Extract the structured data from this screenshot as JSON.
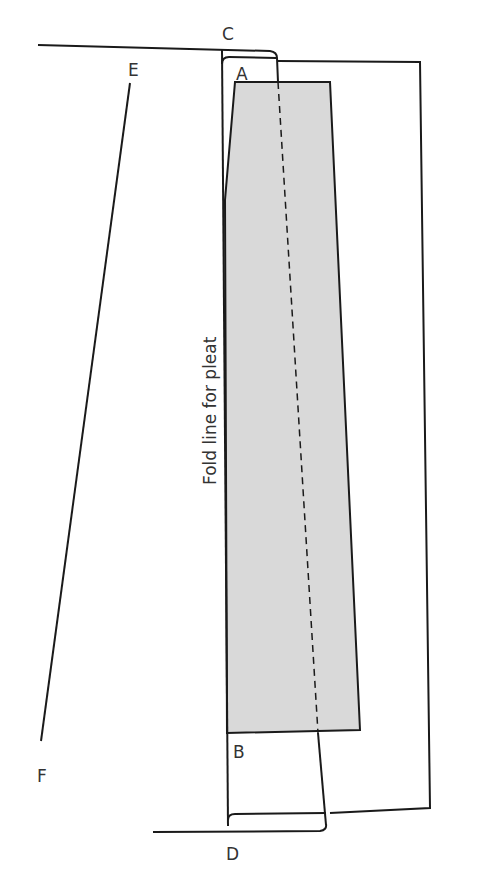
{
  "diagram": {
    "type": "sewing-pattern-pleat",
    "labels": {
      "C": "C",
      "E": "E",
      "A": "A",
      "B": "B",
      "F": "F",
      "D": "D"
    },
    "fold_label": "Fold line for pleat",
    "colors": {
      "line": "#1a1a1a",
      "shade": "#d9d9d9",
      "background": "#ffffff"
    }
  }
}
